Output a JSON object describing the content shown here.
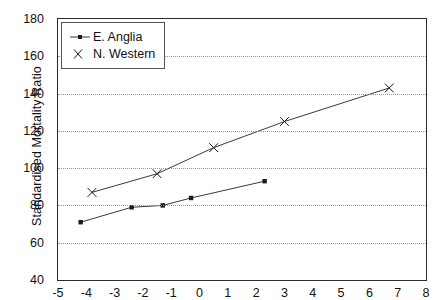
{
  "chart_data": {
    "type": "line",
    "title": "",
    "xlabel": "",
    "ylabel": "Standardised Mortality Ratio",
    "xlim": [
      -5,
      8
    ],
    "ylim": [
      40,
      180
    ],
    "xticks": [
      -5,
      -4,
      -3,
      -2,
      -1,
      0,
      1,
      2,
      3,
      4,
      5,
      6,
      7,
      8
    ],
    "yticks": [
      40,
      60,
      80,
      100,
      120,
      140,
      160,
      180
    ],
    "grid": "horizontal-dotted",
    "legend_position": "upper-left",
    "series": [
      {
        "name": "E. Anglia",
        "marker": "square",
        "x": [
          -4.2,
          -2.4,
          -1.3,
          -0.3,
          2.3
        ],
        "y": [
          71,
          79,
          80,
          84,
          93
        ]
      },
      {
        "name": "N. Western",
        "marker": "x",
        "x": [
          -3.8,
          -1.5,
          0.5,
          3.0,
          6.7
        ],
        "y": [
          87,
          97,
          111,
          125,
          143
        ]
      }
    ]
  },
  "legend": {
    "items": [
      {
        "label": "E. Anglia",
        "marker": "square"
      },
      {
        "label": "N. Western",
        "marker": "x"
      }
    ]
  },
  "axes": {
    "y_title": "Standardised Mortality Ratio",
    "y_tick_labels": [
      "180",
      "160",
      "140",
      "120",
      "100",
      "80",
      "60",
      "40"
    ],
    "x_tick_labels": [
      "-5",
      "-4",
      "-3",
      "-2",
      "-1",
      "0",
      "1",
      "2",
      "3",
      "4",
      "5",
      "6",
      "7",
      "8"
    ]
  },
  "colors": {
    "line": "#3a3a3a",
    "marker": "#1a1a1a",
    "grid": "#9a9a9a",
    "frame": "#2b2b2b",
    "background": "#ffffff"
  }
}
